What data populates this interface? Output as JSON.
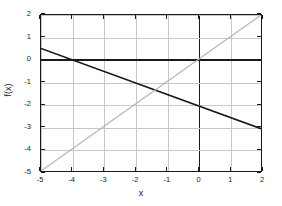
{
  "chart_data": {
    "type": "line",
    "title": "",
    "xlabel": "x",
    "ylabel": "f(x)",
    "xlim": [
      -5,
      2
    ],
    "ylim": [
      -5,
      2
    ],
    "xticks": [
      -5,
      -4,
      -3,
      -2,
      -1,
      0,
      1,
      2
    ],
    "yticks": [
      -5,
      -4,
      -3,
      -2,
      -1,
      0,
      1,
      2
    ],
    "xticklabels": [
      "-5",
      "-4",
      "-3",
      "-2",
      "-1",
      "0",
      "1",
      "2"
    ],
    "yticklabels": [
      "-5",
      "-4",
      "-3",
      "-2",
      "-1",
      "0",
      "1",
      "2"
    ],
    "grid": true,
    "legend": false,
    "series": [
      {
        "name": "f(x)",
        "color": "#1a1a1a",
        "width": 1.6,
        "x": [
          -5,
          2
        ],
        "values": [
          0.5,
          -3.1
        ]
      },
      {
        "name": "y = x",
        "color": "#b4b4b4",
        "width": 1.2,
        "x": [
          -5,
          2
        ],
        "values": [
          -5,
          2
        ]
      }
    ]
  },
  "axes": {
    "x_axis_label": "x",
    "y_axis_label": "f(x)",
    "zero_line_x": "0",
    "zero_line_y": "0"
  }
}
